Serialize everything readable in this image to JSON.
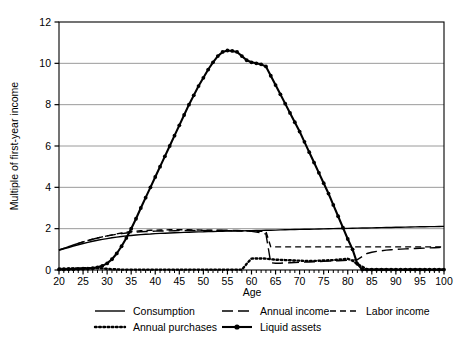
{
  "chart_data": {
    "type": "line",
    "title": "",
    "xlabel": "Age",
    "ylabel": "Multiple of first-year income",
    "xlim": [
      20,
      100
    ],
    "ylim": [
      0,
      12
    ],
    "xticks": [
      20,
      25,
      30,
      35,
      40,
      45,
      50,
      55,
      60,
      65,
      70,
      75,
      80,
      85,
      90,
      95,
      100
    ],
    "yticks": [
      0,
      2,
      4,
      6,
      8,
      10,
      12
    ],
    "xtick_labels": [
      "20",
      "25",
      "30",
      "35",
      "40",
      "45",
      "50",
      "55",
      "60",
      "65",
      "70",
      "75",
      "80",
      "85",
      "90",
      "95",
      "100"
    ],
    "ytick_labels": [
      "0",
      "2",
      "4",
      "6",
      "8",
      "10",
      "12"
    ],
    "minor_xtick_interval": 1,
    "grid": "horizontal",
    "legend_position": "below",
    "x": [
      20,
      21,
      22,
      23,
      24,
      25,
      26,
      27,
      28,
      29,
      30,
      31,
      32,
      33,
      34,
      35,
      36,
      37,
      38,
      39,
      40,
      41,
      42,
      43,
      44,
      45,
      46,
      47,
      48,
      49,
      50,
      51,
      52,
      53,
      54,
      55,
      56,
      57,
      58,
      59,
      60,
      61,
      62,
      63,
      64,
      65,
      66,
      67,
      68,
      69,
      70,
      71,
      72,
      73,
      74,
      75,
      76,
      77,
      78,
      79,
      80,
      81,
      82,
      83,
      84,
      85,
      86,
      87,
      88,
      89,
      90,
      91,
      92,
      93,
      94,
      95,
      96,
      97,
      98,
      99,
      100
    ],
    "series": [
      {
        "name": "Consumption",
        "style": "solid",
        "marker": "none",
        "values": [
          0.95,
          1.02,
          1.09,
          1.16,
          1.22,
          1.28,
          1.34,
          1.39,
          1.44,
          1.48,
          1.52,
          1.56,
          1.59,
          1.62,
          1.65,
          1.67,
          1.69,
          1.71,
          1.73,
          1.74,
          1.76,
          1.77,
          1.78,
          1.79,
          1.8,
          1.81,
          1.82,
          1.83,
          1.84,
          1.845,
          1.85,
          1.86,
          1.865,
          1.87,
          1.875,
          1.88,
          1.885,
          1.89,
          1.895,
          1.9,
          1.905,
          1.91,
          1.915,
          1.92,
          1.925,
          1.93,
          1.94,
          1.95,
          1.955,
          1.96,
          1.965,
          1.97,
          1.975,
          1.98,
          1.985,
          1.99,
          1.995,
          2.0,
          2.005,
          2.01,
          2.015,
          2.02,
          2.025,
          2.03,
          2.035,
          2.04,
          2.045,
          2.05,
          2.055,
          2.06,
          2.065,
          2.07,
          2.075,
          2.08,
          2.085,
          2.09,
          2.095,
          2.1,
          2.1,
          2.105,
          2.11
        ]
      },
      {
        "name": "Annual income",
        "style": "dashed-long",
        "marker": "none",
        "values": [
          0.97,
          1.05,
          1.13,
          1.21,
          1.29,
          1.36,
          1.43,
          1.49,
          1.55,
          1.6,
          1.65,
          1.69,
          1.73,
          1.76,
          1.79,
          1.81,
          1.83,
          1.85,
          1.86,
          1.87,
          1.88,
          1.885,
          1.89,
          1.895,
          1.9,
          1.905,
          1.91,
          1.91,
          1.912,
          1.914,
          1.916,
          1.918,
          1.92,
          1.92,
          1.92,
          1.92,
          1.915,
          1.91,
          1.9,
          1.89,
          1.87,
          1.84,
          1.8,
          1.74,
          0.35,
          0.33,
          0.33,
          0.34,
          0.35,
          0.36,
          0.37,
          0.38,
          0.39,
          0.4,
          0.41,
          0.42,
          0.43,
          0.44,
          0.45,
          0.46,
          0.47,
          0.48,
          0.5,
          0.65,
          0.8,
          0.86,
          0.9,
          0.93,
          0.96,
          0.98,
          1.0,
          1.01,
          1.02,
          1.03,
          1.04,
          1.05,
          1.06,
          1.07,
          1.08,
          1.09,
          1.1
        ]
      },
      {
        "name": "Labor income",
        "style": "dashed-short",
        "marker": "none",
        "values": [
          0.97,
          1.05,
          1.13,
          1.21,
          1.29,
          1.36,
          1.43,
          1.49,
          1.55,
          1.6,
          1.65,
          1.7,
          1.75,
          1.79,
          1.83,
          1.86,
          1.88,
          1.9,
          1.91,
          1.92,
          1.93,
          1.935,
          1.94,
          1.945,
          1.95,
          1.95,
          1.948,
          1.945,
          1.94,
          1.935,
          1.93,
          1.925,
          1.92,
          1.915,
          1.91,
          1.905,
          1.9,
          1.895,
          1.89,
          1.885,
          1.88,
          1.875,
          1.87,
          1.865,
          1.12,
          1.12,
          1.12,
          1.12,
          1.12,
          1.12,
          1.12,
          1.12,
          1.12,
          1.12,
          1.12,
          1.12,
          1.12,
          1.12,
          1.12,
          1.12,
          1.12,
          1.12,
          1.12,
          1.12,
          1.12,
          1.12,
          1.12,
          1.12,
          1.12,
          1.12,
          1.12,
          1.12,
          1.12,
          1.12,
          1.12,
          1.12,
          1.12,
          1.12,
          1.12,
          1.12,
          1.12
        ]
      },
      {
        "name": "Annual purchases",
        "style": "dotted",
        "marker": "none",
        "values": [
          0.06,
          0.06,
          0.07,
          0.07,
          0.08,
          0.08,
          0.09,
          0.09,
          0.09,
          0.08,
          0.06,
          0.04,
          0.03,
          0.02,
          0.02,
          0.02,
          0.02,
          0.02,
          0.02,
          0.02,
          0.02,
          0.02,
          0.02,
          0.02,
          0.02,
          0.02,
          0.02,
          0.02,
          0.02,
          0.02,
          0.02,
          0.02,
          0.02,
          0.02,
          0.02,
          0.02,
          0.02,
          0.02,
          0.02,
          0.3,
          0.55,
          0.56,
          0.56,
          0.55,
          0.52,
          0.5,
          0.49,
          0.48,
          0.47,
          0.46,
          0.45,
          0.44,
          0.44,
          0.44,
          0.45,
          0.46,
          0.47,
          0.48,
          0.5,
          0.52,
          0.54,
          0.45,
          0.28,
          0.16,
          0.03,
          0.02,
          0.02,
          0.02,
          0.02,
          0.02,
          0.02,
          0.02,
          0.02,
          0.02,
          0.02,
          0.02,
          0.02,
          0.02,
          0.02,
          0.02,
          0.02
        ]
      },
      {
        "name": "Liquid assets",
        "style": "solid",
        "marker": "filled-circle",
        "values": [
          0.03,
          0.03,
          0.04,
          0.04,
          0.05,
          0.06,
          0.07,
          0.09,
          0.13,
          0.2,
          0.32,
          0.52,
          0.8,
          1.15,
          1.55,
          2.0,
          2.48,
          3.0,
          3.5,
          4.0,
          4.5,
          5.0,
          5.5,
          6.0,
          6.5,
          7.0,
          7.5,
          8.0,
          8.45,
          8.9,
          9.3,
          9.7,
          10.05,
          10.35,
          10.55,
          10.62,
          10.6,
          10.55,
          10.35,
          10.15,
          10.05,
          10.0,
          9.95,
          9.85,
          9.4,
          8.95,
          8.5,
          8.05,
          7.6,
          7.15,
          6.7,
          6.2,
          5.7,
          5.2,
          4.7,
          4.2,
          3.7,
          3.15,
          2.6,
          2.05,
          1.5,
          1.0,
          0.3,
          0.02,
          0.02,
          0.02,
          0.02,
          0.02,
          0.02,
          0.02,
          0.02,
          0.02,
          0.02,
          0.02,
          0.02,
          0.02,
          0.02,
          0.02,
          0.02,
          0.02,
          0.02
        ]
      }
    ],
    "legend": [
      {
        "label": "Consumption",
        "style": "solid",
        "marker": "none"
      },
      {
        "label": "Annual income",
        "style": "dashed-long",
        "marker": "none"
      },
      {
        "label": "Labor income",
        "style": "dashed-short",
        "marker": "none"
      },
      {
        "label": "Annual purchases",
        "style": "dotted",
        "marker": "none"
      },
      {
        "label": "Liquid assets",
        "style": "solid",
        "marker": "filled-circle"
      }
    ],
    "colors": {
      "line": "#000000",
      "grid": "#808080",
      "axis": "#000000",
      "background": "#ffffff"
    }
  }
}
